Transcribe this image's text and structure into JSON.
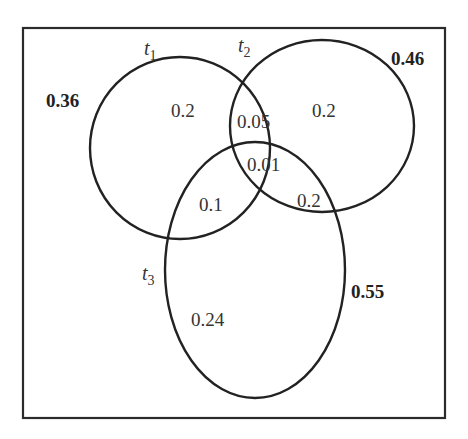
{
  "diagram": {
    "type": "venn",
    "sets": [
      {
        "name": "t",
        "subscript": "1",
        "total": "0.36"
      },
      {
        "name": "t",
        "subscript": "2",
        "total": "0.46"
      },
      {
        "name": "t",
        "subscript": "3",
        "total": "0.55"
      }
    ],
    "regions": {
      "t1_only": "0.2",
      "t2_only": "0.2",
      "t3_only": "0.24",
      "t1_t2_only": "0.05",
      "t1_t3_only": "0.1",
      "t2_t3_only": "0.2",
      "t1_t2_t3": "0.01"
    },
    "colors": {
      "stroke": "#222222",
      "text": "#333333",
      "background": "#ffffff"
    }
  }
}
